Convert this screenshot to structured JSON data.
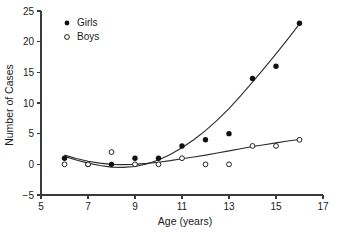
{
  "chart_data": {
    "type": "scatter",
    "title": "",
    "xlabel": "Age (years)",
    "ylabel": "Number of Cases",
    "xlim": [
      5,
      17
    ],
    "ylim": [
      -5,
      25
    ],
    "xticks": [
      5,
      7,
      9,
      11,
      13,
      15,
      17
    ],
    "xtick_labels": [
      "5",
      "7",
      "9",
      "11",
      "13",
      "15",
      "17"
    ],
    "yticks": [
      -5,
      0,
      5,
      10,
      15,
      20,
      25
    ],
    "ytick_labels": [
      "−5",
      "0",
      "5",
      "10",
      "15",
      "20",
      "25"
    ],
    "grid": false,
    "legend_position": "top-left",
    "x": [
      6,
      7,
      8,
      9,
      10,
      11,
      12,
      13,
      14,
      15,
      16
    ],
    "series": [
      {
        "name": "Girls",
        "marker": "filled-circle",
        "color": "#111111",
        "values": [
          1,
          0,
          0,
          1,
          1,
          3,
          4,
          5,
          14,
          16,
          23
        ],
        "fit": "quadratic-trend"
      },
      {
        "name": "Boys",
        "marker": "open-circle",
        "color": "#222222",
        "values": [
          0,
          0,
          2,
          0,
          0,
          1,
          0,
          0,
          3,
          3,
          4
        ],
        "fit": "quadratic-trend"
      }
    ],
    "fit_curves": [
      {
        "name": "Girls fitted curve",
        "points": [
          [
            6,
            1.3
          ],
          [
            6.5,
            0.7
          ],
          [
            7,
            0.2
          ],
          [
            7.5,
            -0.2
          ],
          [
            8,
            -0.45
          ],
          [
            8.5,
            -0.5
          ],
          [
            9,
            -0.35
          ],
          [
            9.5,
            0.05
          ],
          [
            10,
            0.7
          ],
          [
            10.5,
            1.6
          ],
          [
            11,
            2.7
          ],
          [
            11.5,
            4.0
          ],
          [
            12,
            5.5
          ],
          [
            12.5,
            7.2
          ],
          [
            13,
            9.1
          ],
          [
            13.5,
            11.2
          ],
          [
            14,
            13.4
          ],
          [
            14.5,
            15.7
          ],
          [
            15,
            18.0
          ],
          [
            15.5,
            20.4
          ],
          [
            16,
            22.9
          ]
        ]
      },
      {
        "name": "Boys fitted curve",
        "points": [
          [
            6,
            1.5
          ],
          [
            6.5,
            0.95
          ],
          [
            7,
            0.5
          ],
          [
            7.5,
            0.2
          ],
          [
            8,
            0.0
          ],
          [
            8.5,
            -0.05
          ],
          [
            9,
            0.0
          ],
          [
            9.5,
            0.15
          ],
          [
            10,
            0.35
          ],
          [
            10.5,
            0.6
          ],
          [
            11,
            0.9
          ],
          [
            11.5,
            1.2
          ],
          [
            12,
            1.5
          ],
          [
            12.5,
            1.85
          ],
          [
            13,
            2.2
          ],
          [
            13.5,
            2.55
          ],
          [
            14,
            2.9
          ],
          [
            14.5,
            3.2
          ],
          [
            15,
            3.5
          ],
          [
            15.5,
            3.8
          ],
          [
            16,
            4.05
          ]
        ]
      }
    ]
  },
  "legend": {
    "entries": [
      {
        "label": "Girls",
        "marker": "filled-circle"
      },
      {
        "label": "Boys",
        "marker": "open-circle"
      }
    ]
  }
}
